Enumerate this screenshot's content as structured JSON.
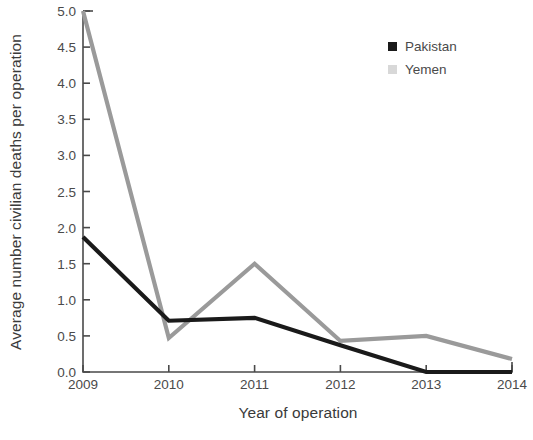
{
  "chart_data": {
    "type": "line",
    "title": "",
    "xlabel": "Year of operation",
    "ylabel": "Average number civilian deaths per operation",
    "x": [
      2009,
      2010,
      2011,
      2012,
      2013,
      2014
    ],
    "xticklabels": [
      "2009",
      "2010",
      "2011",
      "2012",
      "2013",
      "2014"
    ],
    "yticklabels": [
      "0.0",
      "0.5",
      "1.0",
      "1.5",
      "2.0",
      "2.5",
      "3.0",
      "3.5",
      "4.0",
      "4.5",
      "5.0"
    ],
    "yticks": [
      0.0,
      0.5,
      1.0,
      1.5,
      2.0,
      2.5,
      3.0,
      3.5,
      4.0,
      4.5,
      5.0
    ],
    "ylim": [
      0.0,
      5.0
    ],
    "xlim": [
      2009,
      2014
    ],
    "grid": false,
    "legend_position": "top-right",
    "series": [
      {
        "name": "Pakistan",
        "color": "#1a1a1a",
        "values": [
          1.87,
          0.71,
          0.75,
          0.37,
          0.0,
          0.0
        ]
      },
      {
        "name": "Yemen",
        "color": "#9a9a9a",
        "values": [
          5.0,
          0.47,
          1.5,
          0.43,
          0.5,
          0.18
        ]
      }
    ]
  },
  "legend": {
    "items": [
      {
        "label": "Pakistan",
        "color": "#1a1a1a"
      },
      {
        "label": "Yemen",
        "color": "#d8d8d8"
      }
    ]
  }
}
